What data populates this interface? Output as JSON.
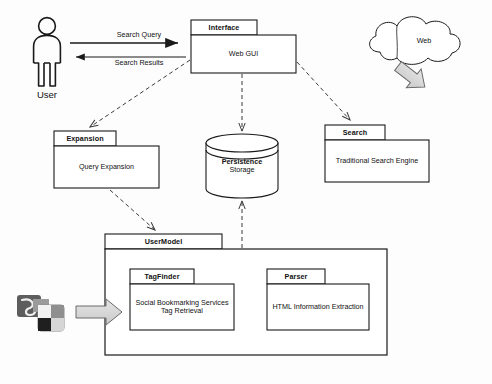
{
  "diagram": {
    "type": "uml-package-diagram",
    "background_color": "#fdfdfd",
    "stroke_color": "#1a1a1a",
    "text_color": "#111111",
    "arrow_fill": "#d9d9d9"
  },
  "actor": {
    "name": "actor-user",
    "label": "User"
  },
  "cloud": {
    "name": "cloud-web",
    "label": "Web"
  },
  "packages": [
    {
      "id": "interface",
      "tab_label": "Interface",
      "body_label": "Web GUI"
    },
    {
      "id": "expansion",
      "tab_label": "Expansion",
      "body_label": "Query Expansion"
    },
    {
      "id": "search",
      "tab_label": "Search",
      "body_label": "Traditional Search Engine"
    },
    {
      "id": "usermodel",
      "tab_label": "UserModel",
      "body_label": ""
    },
    {
      "id": "tagfinder",
      "tab_label": "TagFinder",
      "body_label_line1": "Social Bookmarking Services",
      "body_label_line2": "Tag Retrieval"
    },
    {
      "id": "parser",
      "tab_label": "Parser",
      "body_label": "HTML Information Extraction"
    }
  ],
  "datastore": {
    "name": "persistence-storage-cylinder",
    "label_line1": "Persistence",
    "label_line2": "Storage"
  },
  "edges": [
    {
      "id": "search-query",
      "label": "Search Query",
      "style": "solid",
      "from": "user",
      "to": "interface"
    },
    {
      "id": "search-results",
      "label": "Search Results",
      "style": "solid",
      "from": "interface",
      "to": "user"
    },
    {
      "id": "interface-to-expansion",
      "label": "",
      "style": "dashed",
      "from": "interface",
      "to": "expansion"
    },
    {
      "id": "interface-to-storage",
      "label": "",
      "style": "dashed",
      "from": "interface",
      "to": "persistence-storage"
    },
    {
      "id": "interface-to-search",
      "label": "",
      "style": "dashed",
      "from": "interface",
      "to": "search"
    },
    {
      "id": "expansion-to-usermodel",
      "label": "",
      "style": "dashed",
      "from": "expansion",
      "to": "usermodel"
    },
    {
      "id": "usermodel-to-storage",
      "label": "",
      "style": "dashed",
      "from": "usermodel",
      "to": "persistence-storage"
    },
    {
      "id": "web-to-search",
      "label": "",
      "style": "block-arrow",
      "from": "web",
      "to": "search"
    },
    {
      "id": "bookmark-icons-to-tagfinder",
      "label": "",
      "style": "block-arrow",
      "from": "social-bookmark-icons",
      "to": "tagfinder"
    }
  ],
  "icons": {
    "social_bookmarking": {
      "name": "social-bookmarking-icons",
      "items": [
        "stumbleupon-icon",
        "delicious-icon"
      ]
    }
  }
}
